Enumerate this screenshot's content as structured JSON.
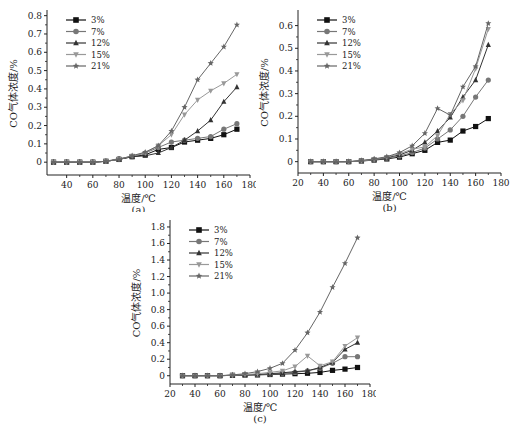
{
  "chart_data": [
    {
      "id": "a",
      "type": "line",
      "caption": "(a)",
      "xlabel": "温度/℃",
      "ylabel": "CO气体浓度/%",
      "xlim": [
        25,
        180
      ],
      "ylim": [
        -0.07,
        0.82
      ],
      "xticks": [
        40,
        60,
        80,
        100,
        120,
        140,
        160,
        180
      ],
      "yticks": [
        0,
        0.1,
        0.2,
        0.3,
        0.4,
        0.5,
        0.6,
        0.7,
        0.8
      ],
      "ytick_labels": [
        "0",
        "0.1",
        "0.2",
        "0.3",
        "0.4",
        "0.5",
        "0.6",
        "0.7",
        "0.8"
      ],
      "grid": false,
      "legend_position": "upper-left",
      "x": [
        30,
        40,
        50,
        60,
        70,
        80,
        90,
        100,
        110,
        120,
        130,
        140,
        150,
        160,
        170
      ],
      "series": [
        {
          "name": "3%",
          "marker": "square",
          "color": "#111111",
          "values": [
            0,
            0,
            0,
            0,
            0.005,
            0.015,
            0.03,
            0.04,
            0.07,
            0.08,
            0.11,
            0.12,
            0.13,
            0.15,
            0.18
          ]
        },
        {
          "name": "7%",
          "marker": "circle",
          "color": "#777777",
          "values": [
            0,
            0,
            0,
            0,
            0.005,
            0.02,
            0.03,
            0.05,
            0.08,
            0.11,
            0.12,
            0.13,
            0.14,
            0.18,
            0.21
          ]
        },
        {
          "name": "12%",
          "marker": "triangle",
          "color": "#333333",
          "values": [
            0,
            0,
            0,
            0,
            0.005,
            0.015,
            0.03,
            0.035,
            0.05,
            0.08,
            0.12,
            0.17,
            0.23,
            0.33,
            0.41
          ]
        },
        {
          "name": "15%",
          "marker": "tri-down",
          "color": "#999999",
          "values": [
            0,
            0,
            0,
            0,
            0.005,
            0.015,
            0.035,
            0.05,
            0.09,
            0.15,
            0.26,
            0.34,
            0.39,
            0.43,
            0.48
          ]
        },
        {
          "name": "21%",
          "marker": "star",
          "color": "#666666",
          "values": [
            0,
            0,
            0,
            0,
            0.005,
            0.015,
            0.035,
            0.055,
            0.09,
            0.17,
            0.3,
            0.45,
            0.54,
            0.63,
            0.75
          ]
        }
      ]
    },
    {
      "id": "b",
      "type": "line",
      "caption": "(b)",
      "xlabel": "温度/℃",
      "ylabel": "CO气体浓度/%",
      "xlim": [
        20,
        180
      ],
      "ylim": [
        -0.05,
        0.66
      ],
      "xticks": [
        20,
        40,
        60,
        80,
        100,
        120,
        140,
        160,
        180
      ],
      "yticks": [
        0,
        0.1,
        0.2,
        0.3,
        0.4,
        0.5,
        0.6
      ],
      "ytick_labels": [
        "0",
        "0.1",
        "0.2",
        "0.3",
        "0.4",
        "0.5",
        "0.6"
      ],
      "grid": false,
      "legend_position": "upper-left",
      "x": [
        30,
        40,
        50,
        60,
        70,
        80,
        90,
        100,
        110,
        120,
        130,
        140,
        150,
        160,
        170
      ],
      "series": [
        {
          "name": "3%",
          "marker": "square",
          "color": "#111111",
          "values": [
            0,
            0,
            0,
            0,
            0.003,
            0.007,
            0.012,
            0.02,
            0.035,
            0.05,
            0.085,
            0.095,
            0.135,
            0.155,
            0.19
          ]
        },
        {
          "name": "7%",
          "marker": "circle",
          "color": "#777777",
          "values": [
            0,
            0,
            0,
            0,
            0.003,
            0.008,
            0.015,
            0.025,
            0.04,
            0.06,
            0.1,
            0.14,
            0.2,
            0.285,
            0.36
          ]
        },
        {
          "name": "12%",
          "marker": "triangle",
          "color": "#333333",
          "values": [
            0,
            0,
            0,
            0,
            0.004,
            0.01,
            0.018,
            0.03,
            0.05,
            0.085,
            0.135,
            0.195,
            0.285,
            0.36,
            0.515
          ]
        },
        {
          "name": "15%",
          "marker": "tri-down",
          "color": "#999999",
          "values": [
            0,
            0,
            0,
            0,
            0.004,
            0.01,
            0.02,
            0.035,
            0.055,
            0.065,
            0.115,
            0.21,
            0.27,
            0.41,
            0.585
          ]
        },
        {
          "name": "21%",
          "marker": "star",
          "color": "#666666",
          "values": [
            0,
            0,
            0,
            0,
            0.005,
            0.012,
            0.022,
            0.04,
            0.07,
            0.125,
            0.235,
            0.205,
            0.33,
            0.42,
            0.61
          ]
        }
      ]
    },
    {
      "id": "c",
      "type": "line",
      "caption": "(c)",
      "xlabel": "温度/℃",
      "ylabel": "CO气体浓度/%",
      "xlim": [
        20,
        180
      ],
      "ylim": [
        -0.1,
        1.86
      ],
      "xticks": [
        20,
        40,
        60,
        80,
        100,
        120,
        140,
        160,
        180
      ],
      "yticks": [
        0,
        0.2,
        0.4,
        0.6,
        0.8,
        1.0,
        1.2,
        1.4,
        1.6,
        1.8
      ],
      "ytick_labels": [
        "0",
        "0.2",
        "0.4",
        "0.6",
        "0.8",
        "1.0",
        "1.2",
        "1.4",
        "1.6",
        "1.8"
      ],
      "grid": false,
      "legend_position": "upper-left",
      "x": [
        30,
        40,
        50,
        60,
        70,
        80,
        90,
        100,
        110,
        120,
        130,
        140,
        150,
        160,
        170
      ],
      "series": [
        {
          "name": "3%",
          "marker": "square",
          "color": "#111111",
          "values": [
            0,
            0,
            0,
            0,
            0.005,
            0.008,
            0.01,
            0.015,
            0.02,
            0.025,
            0.03,
            0.04,
            0.065,
            0.08,
            0.1
          ]
        },
        {
          "name": "7%",
          "marker": "circle",
          "color": "#777777",
          "values": [
            0,
            0,
            0,
            0,
            0.005,
            0.008,
            0.012,
            0.02,
            0.03,
            0.04,
            0.06,
            0.09,
            0.15,
            0.23,
            0.23
          ]
        },
        {
          "name": "12%",
          "marker": "triangle",
          "color": "#333333",
          "values": [
            0,
            0,
            0,
            0,
            0.005,
            0.01,
            0.015,
            0.025,
            0.035,
            0.05,
            0.06,
            0.1,
            0.16,
            0.32,
            0.4
          ]
        },
        {
          "name": "15%",
          "marker": "tri-down",
          "color": "#999999",
          "values": [
            0,
            0,
            0,
            0,
            0.008,
            0.015,
            0.025,
            0.04,
            0.06,
            0.11,
            0.24,
            0.12,
            0.17,
            0.36,
            0.46
          ]
        },
        {
          "name": "21%",
          "marker": "star",
          "color": "#666666",
          "values": [
            0,
            0,
            0,
            0,
            0.01,
            0.025,
            0.05,
            0.09,
            0.15,
            0.31,
            0.52,
            0.77,
            1.07,
            1.36,
            1.67
          ]
        }
      ]
    }
  ],
  "panels": {
    "a": {
      "caption": "(a)",
      "xlabel": "温度/℃",
      "ylabel": "CO气体浓度/%"
    },
    "b": {
      "caption": "(b)",
      "xlabel": "温度/℃",
      "ylabel": "CO气体浓度/%"
    },
    "c": {
      "caption": "(c)",
      "xlabel": "温度/℃",
      "ylabel": "CO气体浓度/%"
    }
  }
}
